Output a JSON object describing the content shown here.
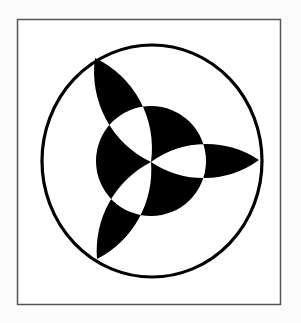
{
  "figure": {
    "background": "#fbfbfb",
    "frame": {
      "x": 17,
      "y": 19,
      "w": 264,
      "h": 286,
      "stroke": "#555555"
    },
    "outer_circle": {
      "cx": 152,
      "cy": 161,
      "rx": 110,
      "ry": 116,
      "stroke": "#000000",
      "stroke_width": 3
    },
    "inner_disc": {
      "cx": 151,
      "cy": 161,
      "r": 55,
      "fill": "#000000"
    },
    "center": {
      "x": 151,
      "y": 162
    },
    "petals": [
      {
        "name": "top-left",
        "tip": [
          95,
          58
        ],
        "arc_radius": 100
      },
      {
        "name": "right",
        "tip": [
          259,
          160
        ],
        "arc_radius": 94
      },
      {
        "name": "bottom-left",
        "tip": [
          97,
          259
        ],
        "arc_radius": 100
      }
    ],
    "fill_rule": "evenodd",
    "ink": "#000000"
  }
}
